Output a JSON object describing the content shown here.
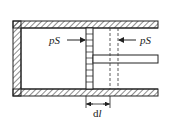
{
  "diagram": {
    "title": "",
    "left_force_label": "pS",
    "right_force_label": "pS",
    "displacement_label_d": "d",
    "displacement_label_l": "l",
    "colors": {
      "stroke": "#222222",
      "background": "#ffffff"
    },
    "components": [
      "cylinder",
      "piston",
      "piston-rod",
      "displaced-piston-position",
      "force-arrow-left",
      "force-arrow-right",
      "displacement-dimension"
    ]
  }
}
